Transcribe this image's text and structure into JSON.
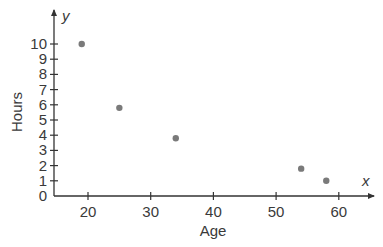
{
  "chart_data": {
    "type": "scatter",
    "title": "",
    "xlabel": "Age",
    "ylabel": "Hours",
    "x_axis_variable": "x",
    "y_axis_variable": "y",
    "xlim": [
      15,
      65
    ],
    "ylim": [
      0,
      10.5
    ],
    "x_ticks": [
      20,
      30,
      40,
      50,
      60
    ],
    "y_ticks": [
      0,
      1,
      2,
      3,
      4,
      5,
      6,
      7,
      8,
      9,
      10
    ],
    "grid": false,
    "legend": null,
    "marker_color": "#7a7a7a",
    "axis_color": "#333333",
    "points": [
      {
        "x": 19,
        "y": 10
      },
      {
        "x": 25,
        "y": 5.8
      },
      {
        "x": 34,
        "y": 3.8
      },
      {
        "x": 54,
        "y": 1.8
      },
      {
        "x": 58,
        "y": 1.0
      }
    ]
  }
}
